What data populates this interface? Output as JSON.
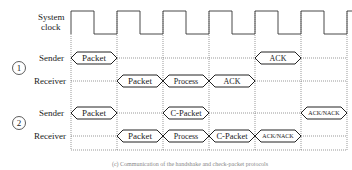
{
  "labels": {
    "clock_line1": "System",
    "clock_line2": "clock",
    "scenario1_number": "1",
    "scenario2_number": "2",
    "sender": "Sender",
    "receiver": "Receiver"
  },
  "grid": {
    "x_lines": [
      71,
      117,
      163,
      209,
      255,
      301,
      347
    ],
    "bottom_y": 150
  },
  "scenario1": {
    "sender": [
      {
        "label": "Packet",
        "slot": 0
      },
      {
        "label": "ACK",
        "slot": 4
      }
    ],
    "receiver": [
      {
        "label": "Packet",
        "slot": 1
      },
      {
        "label": "Process",
        "slot": 2
      },
      {
        "label": "ACK",
        "slot": 3
      }
    ]
  },
  "scenario2": {
    "sender": [
      {
        "label": "Packet",
        "slot": 0
      },
      {
        "label": "C-Packet",
        "slot": 2
      },
      {
        "label": "ACK/NACK",
        "slot": 6
      }
    ],
    "receiver": [
      {
        "label": "Packet",
        "slot": 1
      },
      {
        "label": "Process",
        "slot": 2
      },
      {
        "label": "C-Packet",
        "slot": 3
      },
      {
        "label": "ACK/NACK",
        "slot": 4
      }
    ]
  },
  "caption": "(c) Communication of the handshake and check-packet protocols"
}
